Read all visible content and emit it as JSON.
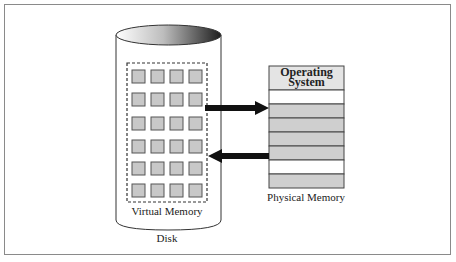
{
  "diagram": {
    "disk": {
      "label": "Disk",
      "virtual_memory_label": "Virtual Memory",
      "page_grid": {
        "rows": 6,
        "cols": 4
      }
    },
    "physical_memory": {
      "label": "Physical Memory",
      "header_label": "Operating System",
      "header_line1": "Operating",
      "header_line2": "System",
      "frames": [
        "empty",
        "filled",
        "filled",
        "filled",
        "filled",
        "empty",
        "filled"
      ]
    },
    "arrows": [
      {
        "from": "virtual-memory",
        "to": "physical-memory",
        "direction": "right"
      },
      {
        "from": "physical-memory",
        "to": "virtual-memory",
        "direction": "left"
      }
    ],
    "colors": {
      "page_fill": "#c8c8c8",
      "frame_filled": "#cfcfcf",
      "frame_empty": "#ffffff",
      "os_header": "#e4e4e4",
      "arrow": "#111111"
    }
  }
}
